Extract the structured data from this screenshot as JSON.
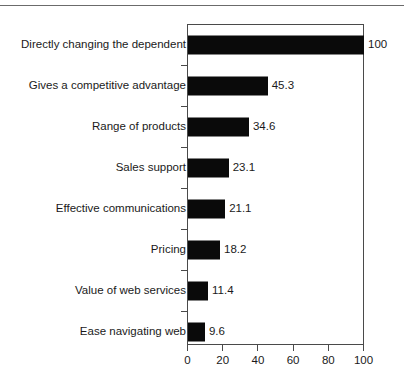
{
  "chart_data": {
    "type": "bar",
    "orientation": "horizontal",
    "title": "",
    "subtitle": "",
    "xlabel": "",
    "ylabel": "",
    "xlim": [
      0,
      100
    ],
    "xticks": [
      0,
      20,
      40,
      60,
      80,
      100
    ],
    "xtick_labels": [
      "0",
      "20",
      "40",
      "60",
      "80",
      "100"
    ],
    "grid": false,
    "legend": false,
    "bar_color": "#0a0a0a",
    "frame_color": "#4a4a4a",
    "text_color": "#1a1a1a",
    "categories": [
      "Directly changing the dependent",
      "Gives a competitive advantage",
      "Range of products",
      "Sales support",
      "Effective communications",
      "Pricing",
      "Value of web services",
      "Ease navigating web"
    ],
    "values": [
      100,
      45.3,
      34.6,
      23.1,
      21.1,
      18.2,
      11.4,
      9.6
    ],
    "value_labels": [
      "100",
      "45.3",
      "34.6",
      "23.1",
      "21.1",
      "18.2",
      "11.4",
      "9.6"
    ]
  }
}
